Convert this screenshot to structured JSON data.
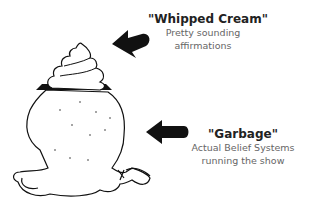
{
  "top_label": {
    "title": "\"Whipped Cream\"",
    "lines": [
      "Pretty sounding",
      "affirmations"
    ]
  },
  "bottom_label": {
    "title": "\"Garbage\"",
    "lines": [
      "Actual Belief Systems",
      "running the show"
    ]
  },
  "illustration": {
    "top_item": "whipped-cream-swirl",
    "bottom_item": "garbage-bag"
  },
  "colors": {
    "arrow": "#111111",
    "title": "#222222",
    "subtitle": "#666666",
    "outline": "#111111"
  }
}
